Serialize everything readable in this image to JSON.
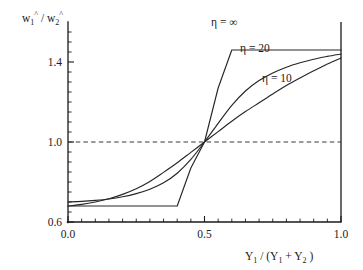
{
  "chart_data": {
    "type": "line",
    "title": "",
    "xlabel": "Y_1 / (Y_1 + Y_2)",
    "ylabel": "w_1^ / w_2^",
    "xlim": [
      0.0,
      1.0
    ],
    "ylim": [
      0.6,
      1.5
    ],
    "grid": false,
    "legend_position": "inline-annotations",
    "xticks": [
      0.0,
      0.5,
      1.0
    ],
    "xticklabels": [
      "0.0",
      "0.5",
      "1.0"
    ],
    "yticks": [
      0.6,
      1.0,
      1.4
    ],
    "yticklabels": [
      "0.6",
      "1.0",
      "1.4"
    ],
    "xminorticks": [
      0.05,
      0.1,
      0.15,
      0.2,
      0.25,
      0.3,
      0.35,
      0.4,
      0.45,
      0.55,
      0.6,
      0.65,
      0.7,
      0.75,
      0.8,
      0.85,
      0.9,
      0.95
    ],
    "yminorticks": [
      0.65,
      0.7,
      0.75,
      0.8,
      0.85,
      0.9,
      0.95,
      1.05,
      1.1,
      1.15,
      1.2,
      1.25,
      1.3,
      1.35,
      1.45
    ],
    "reference_lines": [
      {
        "name": "unity-line",
        "orientation": "horizontal",
        "value": 1.0,
        "style": "dashed"
      }
    ],
    "series": [
      {
        "name": "eta-infinity",
        "label": "η = ∞",
        "x": [
          0.0,
          0.05,
          0.1,
          0.15,
          0.2,
          0.25,
          0.3,
          0.35,
          0.4,
          0.45,
          0.5,
          0.55,
          0.6,
          0.65,
          0.7,
          0.75,
          0.8,
          0.85,
          0.9,
          0.95,
          1.0
        ],
        "values": [
          0.68,
          0.68,
          0.68,
          0.68,
          0.68,
          0.68,
          0.68,
          0.68,
          0.68,
          0.87,
          1.0,
          1.27,
          1.46,
          1.46,
          1.46,
          1.46,
          1.46,
          1.46,
          1.46,
          1.46,
          1.46
        ]
      },
      {
        "name": "eta-20",
        "label": "η = 20",
        "x": [
          0.0,
          0.05,
          0.1,
          0.15,
          0.2,
          0.25,
          0.3,
          0.35,
          0.4,
          0.45,
          0.5,
          0.55,
          0.6,
          0.65,
          0.7,
          0.75,
          0.8,
          0.85,
          0.9,
          0.95,
          1.0
        ],
        "values": [
          0.7,
          0.703,
          0.708,
          0.715,
          0.726,
          0.742,
          0.764,
          0.796,
          0.844,
          0.913,
          1.0,
          1.093,
          1.183,
          1.255,
          1.307,
          1.345,
          1.374,
          1.396,
          1.414,
          1.428,
          1.44
        ]
      },
      {
        "name": "eta-10",
        "label": "η = 10",
        "x": [
          0.0,
          0.05,
          0.1,
          0.15,
          0.2,
          0.25,
          0.3,
          0.35,
          0.4,
          0.45,
          0.5,
          0.55,
          0.6,
          0.65,
          0.7,
          0.75,
          0.8,
          0.85,
          0.9,
          0.95,
          1.0
        ],
        "values": [
          0.68,
          0.688,
          0.7,
          0.716,
          0.738,
          0.766,
          0.802,
          0.848,
          0.896,
          0.948,
          1.0,
          1.052,
          1.104,
          1.152,
          1.196,
          1.24,
          1.282,
          1.32,
          1.356,
          1.39,
          1.42
        ]
      }
    ],
    "annotations": [
      {
        "name": "annotation-eta-infinity",
        "text": "η = ∞",
        "x_px": 211,
        "y_px": 26
      },
      {
        "name": "annotation-eta-20",
        "text": "η = 20",
        "x_px": 240,
        "y_px": 52
      },
      {
        "name": "annotation-eta-10",
        "text": "η = 10",
        "x_px": 262,
        "y_px": 82
      }
    ],
    "axis_label_parts": {
      "y": {
        "w1": "w",
        "sub1": "1",
        "sup1": "^",
        "slash": "/",
        "w2": "w",
        "sub2": "2",
        "sup2": "^"
      },
      "x": {
        "y1a": "Y",
        "sub1a": "1",
        "slash": "/ (",
        "y1b": "Y",
        "sub1b": "1",
        "plus": "+",
        "y2": "Y",
        "sub2": "2",
        "close": ")"
      }
    },
    "colors": {
      "axis": "#1a1a1a",
      "curve": "#262626",
      "reference": "#3a3a3a",
      "background": "#ffffff"
    }
  }
}
